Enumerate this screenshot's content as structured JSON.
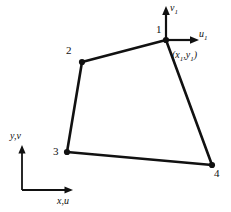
{
  "figure": {
    "background_color": "#ffffff",
    "stroke_color": "#111111",
    "nodes": [
      {
        "id": "1",
        "label": "1",
        "x": 166,
        "y": 40
      },
      {
        "id": "2",
        "label": "2",
        "x": 82,
        "y": 62
      },
      {
        "id": "3",
        "label": "3",
        "x": 67,
        "y": 152
      },
      {
        "id": "4",
        "label": "4",
        "x": 212,
        "y": 165
      }
    ],
    "edges": [
      {
        "from": "1",
        "to": "2"
      },
      {
        "from": "2",
        "to": "3"
      },
      {
        "from": "3",
        "to": "4"
      },
      {
        "from": "4",
        "to": "1"
      }
    ],
    "local_axes": {
      "origin_node": "1",
      "vertical": {
        "label": "v",
        "subscript": "1",
        "tip_x": 166,
        "tip_y": 8
      },
      "horizontal": {
        "label": "u",
        "subscript": "1",
        "tip_x": 197,
        "tip_y": 40
      }
    },
    "coordinate_label": {
      "open": "(",
      "x_symbol": "x",
      "x_subscript": "1",
      "separator": ",",
      "y_symbol": "y",
      "y_subscript": "1",
      "close": ")"
    },
    "global_axes": {
      "origin_x": 22,
      "origin_y": 190,
      "vertical": {
        "label": "y,v",
        "tip_x": 22,
        "tip_y": 146
      },
      "horizontal": {
        "label": "x,u",
        "tip_x": 72,
        "tip_y": 190
      }
    }
  }
}
